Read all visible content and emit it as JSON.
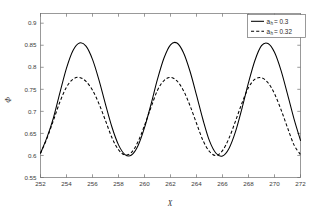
{
  "chart_data": {
    "type": "line",
    "title": "",
    "xlabel": "X",
    "ylabel": "Φ",
    "xlim": [
      252,
      272
    ],
    "ylim": [
      0.55,
      0.922
    ],
    "grid": false,
    "legend_position": "top-right",
    "xticks": [
      252,
      254,
      256,
      258,
      260,
      262,
      264,
      266,
      268,
      270,
      272
    ],
    "xtick_labels": [
      "252",
      "254",
      "256",
      "258",
      "260",
      "262",
      "264",
      "266",
      "268",
      "270",
      "272"
    ],
    "yticks": [
      0.55,
      0.6,
      0.65,
      0.7,
      0.75,
      0.8,
      0.85,
      0.9
    ],
    "ytick_labels": [
      "0.55",
      "0.6",
      "0.65",
      "0.7",
      "0.75",
      "0.8",
      "0.85",
      "0.9"
    ],
    "series": [
      {
        "name": "a_h = 0.3",
        "legend_label": "a",
        "legend_subscript": "h",
        "legend_value": "= 0.3",
        "style": "solid",
        "color": "#000000",
        "peak_value": 0.855,
        "trough_value": 0.598,
        "period": 6.85,
        "peaks_x": [
          254.95,
          261.85,
          268.7
        ],
        "troughs_x": [
          258.45,
          265.3
        ],
        "x": [
          252.0,
          252.5,
          253.0,
          253.5,
          254.0,
          254.5,
          255.0,
          255.5,
          256.0,
          256.5,
          257.0,
          257.5,
          258.0,
          258.5,
          259.0,
          259.5,
          260.0,
          260.5,
          261.0,
          261.5,
          262.0,
          262.5,
          263.0,
          263.5,
          264.0,
          264.5,
          265.0,
          265.5,
          266.0,
          266.5,
          267.0,
          267.5,
          268.0,
          268.5,
          269.0,
          269.5,
          270.0,
          270.5,
          271.0,
          271.5,
          272.0
        ],
        "y": [
          0.605,
          0.641,
          0.686,
          0.743,
          0.798,
          0.838,
          0.855,
          0.848,
          0.818,
          0.771,
          0.716,
          0.664,
          0.624,
          0.602,
          0.601,
          0.622,
          0.663,
          0.716,
          0.773,
          0.821,
          0.851,
          0.855,
          0.833,
          0.791,
          0.737,
          0.681,
          0.633,
          0.605,
          0.599,
          0.616,
          0.654,
          0.707,
          0.765,
          0.816,
          0.849,
          0.854,
          0.834,
          0.793,
          0.739,
          0.683,
          0.634
        ]
      },
      {
        "name": "a_h = 0.32",
        "legend_label": "a",
        "legend_subscript": "h",
        "legend_value": "= 0.32",
        "style": "dashed",
        "color": "#000000",
        "peak_value": 0.777,
        "trough_value": 0.598,
        "period": 6.6,
        "peaks_x": [
          254.9,
          261.4,
          267.9
        ],
        "troughs_x": [
          258.2,
          264.7,
          271.2
        ],
        "x": [
          252.0,
          252.5,
          253.0,
          253.5,
          254.0,
          254.5,
          255.0,
          255.5,
          256.0,
          256.5,
          257.0,
          257.5,
          258.0,
          258.5,
          259.0,
          259.5,
          260.0,
          260.5,
          261.0,
          261.5,
          262.0,
          262.5,
          263.0,
          263.5,
          264.0,
          264.5,
          265.0,
          265.5,
          266.0,
          266.5,
          267.0,
          267.5,
          268.0,
          268.5,
          269.0,
          269.5,
          270.0,
          270.5,
          271.0,
          271.5,
          272.0
        ],
        "y": [
          0.605,
          0.639,
          0.68,
          0.722,
          0.755,
          0.773,
          0.777,
          0.768,
          0.748,
          0.717,
          0.679,
          0.64,
          0.613,
          0.601,
          0.607,
          0.631,
          0.668,
          0.709,
          0.748,
          0.77,
          0.777,
          0.769,
          0.747,
          0.713,
          0.673,
          0.634,
          0.609,
          0.6,
          0.611,
          0.639,
          0.678,
          0.719,
          0.754,
          0.773,
          0.776,
          0.765,
          0.74,
          0.704,
          0.663,
          0.624,
          0.602
        ]
      }
    ]
  },
  "figure": {
    "background_color": "#ffffff",
    "axis_color": "#6e6e6e",
    "line_color": "#000000"
  }
}
